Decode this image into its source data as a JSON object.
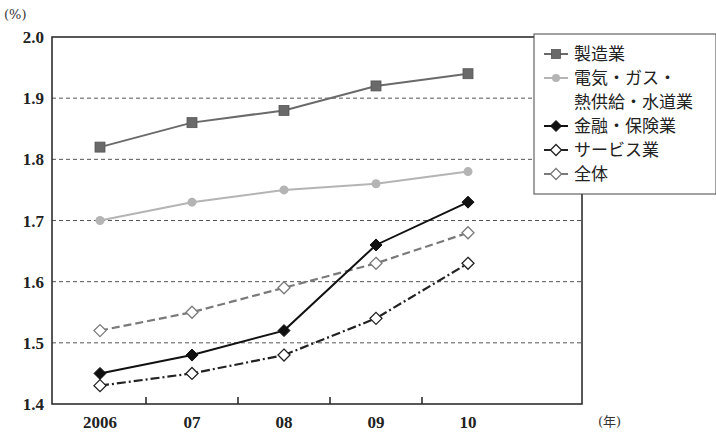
{
  "chart_data": {
    "type": "line",
    "title": "",
    "xlabel": "(年)",
    "ylabel": "(%)",
    "categories": [
      "2006",
      "07",
      "08",
      "09",
      "10"
    ],
    "ylim": [
      1.4,
      2.0
    ],
    "yticks": [
      "1.4",
      "1.5",
      "1.6",
      "1.7",
      "1.8",
      "1.9",
      "2.0"
    ],
    "grid": "horizontal dashed",
    "legend_position": "right",
    "series": [
      {
        "name": "製造業",
        "legend_lines": [
          "製造業"
        ],
        "values": [
          1.82,
          1.86,
          1.88,
          1.92,
          1.94
        ],
        "color": "#6a6a6a",
        "marker": "square-filled",
        "line": "solid"
      },
      {
        "name": "電気・ガス・熱供給・水道業",
        "legend_lines": [
          "電気・ガス・",
          "熱供給・水道業"
        ],
        "values": [
          1.7,
          1.73,
          1.75,
          1.76,
          1.78
        ],
        "color": "#b4b4b4",
        "marker": "circle-filled",
        "line": "solid"
      },
      {
        "name": "金融・保険業",
        "legend_lines": [
          "金融・保険業"
        ],
        "values": [
          1.45,
          1.48,
          1.52,
          1.66,
          1.73
        ],
        "color": "#111111",
        "marker": "diamond-filled",
        "line": "solid"
      },
      {
        "name": "サービス業",
        "legend_lines": [
          "サービス業"
        ],
        "values": [
          1.43,
          1.45,
          1.48,
          1.54,
          1.63
        ],
        "color": "#222222",
        "marker": "diamond-open",
        "line": "dashdot"
      },
      {
        "name": "全体",
        "legend_lines": [
          "全体"
        ],
        "values": [
          1.52,
          1.55,
          1.59,
          1.63,
          1.68
        ],
        "color": "#7a7a7a",
        "marker": "diamond-open",
        "line": "dashed"
      }
    ]
  }
}
